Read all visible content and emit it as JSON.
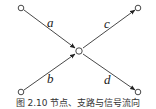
{
  "diagram": {
    "type": "signal-flow-graph",
    "nodes": [
      {
        "id": "top-left",
        "x": 21,
        "y": 8
      },
      {
        "id": "bottom-left",
        "x": 21,
        "y": 92
      },
      {
        "id": "center",
        "x": 79,
        "y": 51
      },
      {
        "id": "top-right",
        "x": 138,
        "y": 8
      },
      {
        "id": "bottom-right",
        "x": 138,
        "y": 92
      }
    ],
    "edges": [
      {
        "from": "top-left",
        "to": "center",
        "label": "a"
      },
      {
        "from": "bottom-left",
        "to": "center",
        "label": "b"
      },
      {
        "from": "center",
        "to": "top-right",
        "label": "c"
      },
      {
        "from": "center",
        "to": "bottom-right",
        "label": "d"
      }
    ],
    "labels": {
      "a": "a",
      "b": "b",
      "c": "c",
      "d": "d"
    },
    "caption": "图 2.10   节点、支路与信号流向"
  }
}
